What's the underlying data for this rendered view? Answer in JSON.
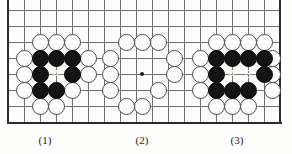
{
  "figure": {
    "kind": "go-board-diagram",
    "board_edge_color": "#2b2b2b",
    "grid_color": "#6f6f70",
    "white_stone_color": "#fcfcfc",
    "black_stone_color": "#131313",
    "grid_spacing_px": 16,
    "captions": [
      {
        "text": "(1)",
        "x": 25,
        "y": 134
      },
      {
        "text": "(2)",
        "x": 122,
        "y": 134
      },
      {
        "text": "(3)",
        "x": 217,
        "y": 134
      }
    ],
    "star_points": [
      {
        "x": 142,
        "y": 74
      }
    ],
    "grid_lines": {
      "horizontal_y": [
        10,
        26,
        42,
        58,
        74,
        90,
        106,
        122
      ],
      "vertical_x": [
        8,
        24,
        40,
        56,
        72,
        88,
        104,
        120,
        136,
        152,
        168,
        184,
        200,
        216,
        232,
        248,
        264,
        280
      ]
    },
    "edges": {
      "left_x": 8,
      "right_x": 280,
      "bottom_y": 122,
      "top_open": true
    },
    "groups": [
      {
        "name": "position-1",
        "label": "(1)",
        "white": [
          {
            "x": 40,
            "y": 42
          },
          {
            "x": 56,
            "y": 42
          },
          {
            "x": 72,
            "y": 42
          },
          {
            "x": 24,
            "y": 58
          },
          {
            "x": 88,
            "y": 58
          },
          {
            "x": 24,
            "y": 74
          },
          {
            "x": 88,
            "y": 74
          },
          {
            "x": 24,
            "y": 90
          },
          {
            "x": 72,
            "y": 90
          },
          {
            "x": 40,
            "y": 106
          },
          {
            "x": 56,
            "y": 106
          }
        ],
        "black": [
          {
            "x": 40,
            "y": 58
          },
          {
            "x": 56,
            "y": 58
          },
          {
            "x": 72,
            "y": 58
          },
          {
            "x": 40,
            "y": 74
          },
          {
            "x": 72,
            "y": 74
          },
          {
            "x": 40,
            "y": 90
          },
          {
            "x": 56,
            "y": 90
          }
        ],
        "markers": [
          {
            "text": "A",
            "x": 56,
            "y": 74,
            "on": "empty"
          }
        ]
      },
      {
        "name": "position-2",
        "label": "(2)",
        "white": [
          {
            "x": 126,
            "y": 42
          },
          {
            "x": 142,
            "y": 42
          },
          {
            "x": 158,
            "y": 42
          },
          {
            "x": 110,
            "y": 58
          },
          {
            "x": 174,
            "y": 58
          },
          {
            "x": 110,
            "y": 74
          },
          {
            "x": 174,
            "y": 74
          },
          {
            "x": 110,
            "y": 90
          },
          {
            "x": 158,
            "y": 90
          },
          {
            "x": 126,
            "y": 106
          },
          {
            "x": 142,
            "y": 106
          }
        ],
        "black": [],
        "markers": []
      },
      {
        "name": "position-3",
        "label": "(3)",
        "white": [
          {
            "x": 216,
            "y": 42
          },
          {
            "x": 232,
            "y": 42
          },
          {
            "x": 248,
            "y": 42
          },
          {
            "x": 264,
            "y": 42
          },
          {
            "x": 200,
            "y": 58
          },
          {
            "x": 272,
            "y": 58
          },
          {
            "x": 200,
            "y": 74
          },
          {
            "x": 272,
            "y": 74
          },
          {
            "x": 200,
            "y": 90
          },
          {
            "x": 272,
            "y": 90
          },
          {
            "x": 216,
            "y": 106
          },
          {
            "x": 232,
            "y": 106
          },
          {
            "x": 248,
            "y": 106
          }
        ],
        "black": [
          {
            "x": 216,
            "y": 58
          },
          {
            "x": 232,
            "y": 58
          },
          {
            "x": 248,
            "y": 58
          },
          {
            "x": 264,
            "y": 58
          },
          {
            "x": 216,
            "y": 74
          },
          {
            "x": 264,
            "y": 74
          },
          {
            "x": 216,
            "y": 90
          },
          {
            "x": 232,
            "y": 90
          },
          {
            "x": 248,
            "y": 90
          }
        ],
        "markers": [
          {
            "text": "A",
            "x": 232,
            "y": 74,
            "on": "empty"
          },
          {
            "text": "B",
            "x": 248,
            "y": 74,
            "on": "empty"
          }
        ]
      }
    ]
  }
}
